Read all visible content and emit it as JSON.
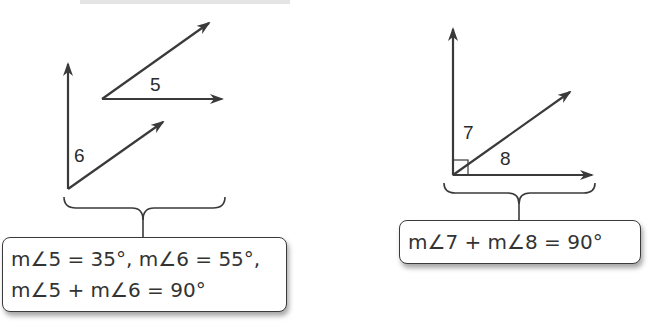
{
  "left_figure": {
    "angle_labels": {
      "angle5": "5",
      "angle6": "6"
    },
    "equations": [
      "m∠5 = 35°, m∠6 = 55°,",
      "m∠5 +  m∠6 = 90°"
    ]
  },
  "right_figure": {
    "angle_labels": {
      "angle7": "7",
      "angle8": "8"
    },
    "equations": [
      "m∠7 +  m∠8 = 90°"
    ]
  },
  "colors": {
    "stroke": "#3a3a3a",
    "text": "#333333"
  }
}
